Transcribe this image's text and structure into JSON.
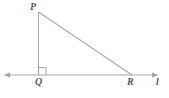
{
  "figure": {
    "kind": "right-triangle-on-line-diagram",
    "background_color": "#ffffff",
    "stroke_color": "#a7a7a9",
    "label_color": "#58585a",
    "labels": {
      "vertex_p": "P",
      "vertex_q": "Q",
      "vertex_r": "R",
      "line_l": "l"
    },
    "points": {
      "P": {
        "x": 38.5,
        "y": 12
      },
      "Q": {
        "x": 38.5,
        "y": 75
      },
      "R": {
        "x": 132,
        "y": 75
      }
    },
    "line_l_segment": {
      "x1": 4,
      "y1": 75,
      "x2": 158,
      "y2": 75,
      "arrow_left": true,
      "arrow_right": true
    },
    "right_angle_marker": {
      "at_vertex": "Q",
      "size": 7.5,
      "orientation": "upper-right"
    },
    "segments": [
      {
        "name": "PQ",
        "from": "P",
        "to": "Q",
        "description": "vertical leg"
      },
      {
        "name": "PR",
        "from": "P",
        "to": "R",
        "description": "hypotenuse"
      },
      {
        "name": "QR",
        "from": "Q",
        "to": "R",
        "description": "horizontal leg along line l"
      }
    ]
  }
}
